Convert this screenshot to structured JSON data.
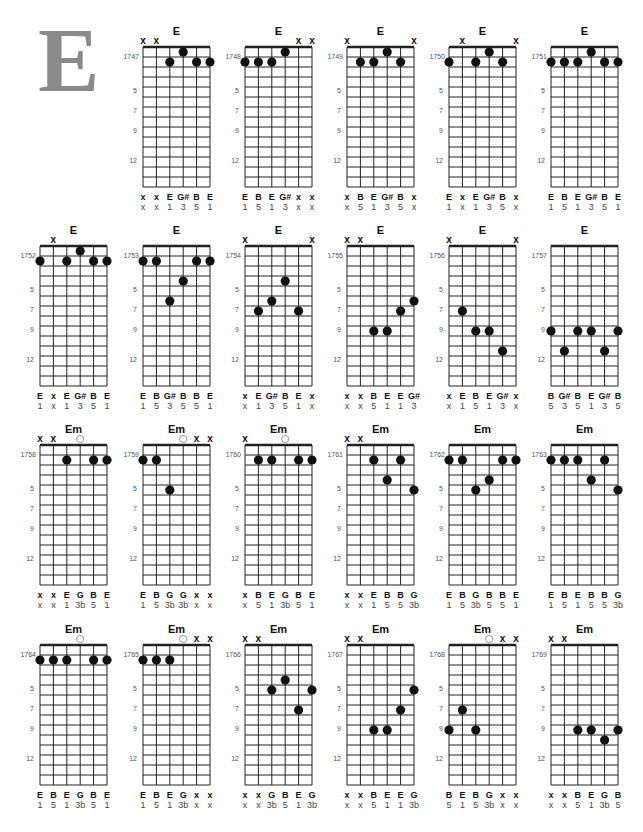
{
  "page": {
    "big_letter": "E",
    "colors": {
      "ink": "#111111",
      "grid": "#222222",
      "big_letter": "#8a8a8a",
      "open_circle": "#999999",
      "label_gray": "#555555"
    },
    "fret_markers": [
      "5",
      "7",
      "9",
      "12"
    ]
  },
  "diagrams": [
    {
      "id": "1747",
      "name": "E",
      "frets": [
        "x",
        "x",
        2,
        1,
        2,
        2
      ],
      "notes": [
        "x",
        "x",
        "E",
        "G#",
        "B",
        "E"
      ],
      "degrees": [
        "x",
        "x",
        "1",
        "3",
        "5",
        "1"
      ]
    },
    {
      "id": "1748",
      "name": "E",
      "frets": [
        2,
        2,
        2,
        1,
        "x",
        "x"
      ],
      "notes": [
        "E",
        "B",
        "E",
        "G#",
        "x",
        "x"
      ],
      "degrees": [
        "1",
        "5",
        "1",
        "3",
        "x",
        "x"
      ]
    },
    {
      "id": "1749",
      "name": "E",
      "frets": [
        "x",
        2,
        2,
        1,
        2,
        "x"
      ],
      "notes": [
        "x",
        "B",
        "E",
        "G#",
        "B",
        "x"
      ],
      "degrees": [
        "x",
        "5",
        "1",
        "3",
        "5",
        "x"
      ]
    },
    {
      "id": "1750",
      "name": "E",
      "frets": [
        2,
        "x",
        2,
        1,
        2,
        "x"
      ],
      "notes": [
        "E",
        "x",
        "E",
        "G#",
        "B",
        "x"
      ],
      "degrees": [
        "1",
        "x",
        "1",
        "3",
        "5",
        "x"
      ]
    },
    {
      "id": "1751",
      "name": "E",
      "frets": [
        2,
        2,
        2,
        1,
        2,
        2
      ],
      "notes": [
        "E",
        "B",
        "E",
        "G#",
        "B",
        "E"
      ],
      "degrees": [
        "1",
        "5",
        "1",
        "3",
        "5",
        "1"
      ]
    },
    {
      "id": "1752",
      "name": "E",
      "frets": [
        2,
        "x",
        2,
        1,
        2,
        2
      ],
      "notes": [
        "E",
        "x",
        "E",
        "G#",
        "B",
        "E"
      ],
      "degrees": [
        "1",
        "x",
        "1",
        "3",
        "5",
        "1"
      ]
    },
    {
      "id": "1753",
      "name": "E",
      "frets": [
        2,
        2,
        6,
        4,
        2,
        2
      ],
      "notes": [
        "E",
        "B",
        "G#",
        "B",
        "B",
        "E"
      ],
      "degrees": [
        "1",
        "5",
        "3",
        "5",
        "5",
        "1"
      ]
    },
    {
      "id": "1754",
      "name": "E",
      "frets": [
        "x",
        7,
        6,
        4,
        7,
        "x"
      ],
      "notes": [
        "x",
        "E",
        "G#",
        "B",
        "E",
        "x"
      ],
      "degrees": [
        "x",
        "1",
        "3",
        "5",
        "1",
        "x"
      ]
    },
    {
      "id": "1755",
      "name": "E",
      "frets": [
        "x",
        "x",
        9,
        9,
        7,
        6
      ],
      "notes": [
        "x",
        "x",
        "B",
        "E",
        "E",
        "G#"
      ],
      "degrees": [
        "x",
        "x",
        "5",
        "1",
        "1",
        "3"
      ]
    },
    {
      "id": "1756",
      "name": "E",
      "frets": [
        "x",
        7,
        9,
        9,
        11,
        "x"
      ],
      "notes": [
        "x",
        "E",
        "B",
        "E",
        "G#",
        "x"
      ],
      "degrees": [
        "x",
        "1",
        "5",
        "1",
        "3",
        "x"
      ]
    },
    {
      "id": "1757",
      "name": "E",
      "frets": [
        9,
        11,
        9,
        9,
        11,
        9
      ],
      "notes": [
        "B",
        "G#",
        "B",
        "E",
        "G#",
        "B"
      ],
      "degrees": [
        "5",
        "3",
        "5",
        "1",
        "3",
        "5"
      ]
    },
    {
      "id": "1758",
      "name": "Em",
      "frets": [
        "x",
        "x",
        2,
        0,
        2,
        2
      ],
      "notes": [
        "x",
        "x",
        "E",
        "G",
        "B",
        "E"
      ],
      "degrees": [
        "x",
        "x",
        "1",
        "3b",
        "5",
        "1"
      ]
    },
    {
      "id": "1759",
      "name": "Em",
      "frets": [
        2,
        2,
        5,
        0,
        "x",
        "x"
      ],
      "notes": [
        "E",
        "B",
        "G",
        "G",
        "x",
        "x"
      ],
      "degrees": [
        "1",
        "5",
        "3b",
        "3b",
        "x",
        "x"
      ]
    },
    {
      "id": "1760",
      "name": "Em",
      "frets": [
        "x",
        2,
        2,
        0,
        2,
        2
      ],
      "notes": [
        "x",
        "B",
        "E",
        "G",
        "B",
        "E"
      ],
      "degrees": [
        "x",
        "5",
        "1",
        "3b",
        "5",
        "1"
      ]
    },
    {
      "id": "1761",
      "name": "Em",
      "frets": [
        "x",
        "x",
        2,
        4,
        2,
        5
      ],
      "notes": [
        "x",
        "x",
        "E",
        "B",
        "B",
        "G"
      ],
      "degrees": [
        "x",
        "x",
        "1",
        "5",
        "5",
        "3b"
      ]
    },
    {
      "id": "1762",
      "name": "Em",
      "frets": [
        2,
        2,
        5,
        4,
        2,
        2
      ],
      "notes": [
        "E",
        "B",
        "G",
        "B",
        "B",
        "E"
      ],
      "degrees": [
        "1",
        "5",
        "3b",
        "5",
        "5",
        "1"
      ]
    },
    {
      "id": "1763",
      "name": "Em",
      "frets": [
        2,
        2,
        2,
        4,
        2,
        5
      ],
      "notes": [
        "E",
        "B",
        "E",
        "B",
        "B",
        "G"
      ],
      "degrees": [
        "1",
        "5",
        "1",
        "5",
        "5",
        "3b"
      ]
    },
    {
      "id": "1764",
      "name": "Em",
      "frets": [
        2,
        2,
        2,
        0,
        2,
        2
      ],
      "notes": [
        "E",
        "B",
        "E",
        "G",
        "B",
        "E"
      ],
      "degrees": [
        "1",
        "5",
        "1",
        "3b",
        "5",
        "1"
      ]
    },
    {
      "id": "1765",
      "name": "Em",
      "frets": [
        2,
        2,
        2,
        0,
        "x",
        "x"
      ],
      "notes": [
        "E",
        "B",
        "E",
        "G",
        "x",
        "x"
      ],
      "degrees": [
        "1",
        "5",
        "1",
        "3b",
        "x",
        "x"
      ]
    },
    {
      "id": "1766",
      "name": "Em",
      "frets": [
        "x",
        "x",
        5,
        4,
        7,
        5
      ],
      "notes": [
        "x",
        "x",
        "G",
        "B",
        "E",
        "G"
      ],
      "degrees": [
        "x",
        "x",
        "3b",
        "5",
        "1",
        "3b"
      ]
    },
    {
      "id": "1767",
      "name": "Em",
      "frets": [
        "x",
        "x",
        9,
        9,
        7,
        5
      ],
      "notes": [
        "x",
        "x",
        "B",
        "E",
        "E",
        "G"
      ],
      "degrees": [
        "x",
        "x",
        "5",
        "1",
        "1",
        "3b"
      ]
    },
    {
      "id": "1768",
      "name": "Em",
      "frets": [
        9,
        7,
        9,
        0,
        "x",
        "x"
      ],
      "notes": [
        "B",
        "E",
        "B",
        "G",
        "x",
        "x"
      ],
      "degrees": [
        "5",
        "1",
        "5",
        "3b",
        "x",
        "x"
      ]
    },
    {
      "id": "1769",
      "name": "Em",
      "frets": [
        "x",
        "x",
        9,
        9,
        10,
        9
      ],
      "notes": [
        "x",
        "x",
        "B",
        "E",
        "G",
        "B"
      ],
      "degrees": [
        "x",
        "x",
        "5",
        "1",
        "3b",
        "5"
      ]
    }
  ]
}
